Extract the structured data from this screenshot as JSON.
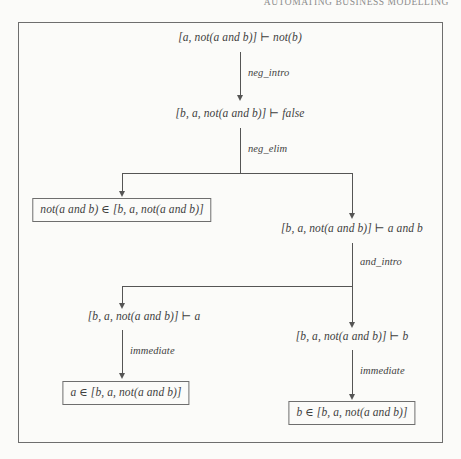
{
  "page": {
    "running_head": "AUTOMATING BUSINESS MODELLING"
  },
  "figure": {
    "nodes": [
      {
        "id": "goal",
        "text": "[a, not(a and b)] ⊢ not(b)",
        "boxed": false
      },
      {
        "id": "false-goal",
        "text": "[b, a, not(a and b)] ⊢ false",
        "boxed": false
      },
      {
        "id": "membership-notab",
        "text": "not(a and b) ∈ [b, a, not(a and b)]",
        "boxed": true
      },
      {
        "id": "a-and-b-goal",
        "text": "[b, a, not(a and b)] ⊢ a and b",
        "boxed": false
      },
      {
        "id": "a-goal",
        "text": "[b, a, not(a and b)] ⊢ a",
        "boxed": false
      },
      {
        "id": "b-goal",
        "text": "[b, a, not(a and b)] ⊢ b",
        "boxed": false
      },
      {
        "id": "membership-a",
        "text": "a ∈ [b, a, not(a and b)]",
        "boxed": true
      },
      {
        "id": "membership-b",
        "text": "b ∈ [b, a, not(a and b)]",
        "boxed": true
      }
    ],
    "edges": [
      {
        "id": "e1",
        "label": "neg_intro",
        "from": "goal",
        "to": "false-goal"
      },
      {
        "id": "e2",
        "label": "neg_elim",
        "from": "false-goal",
        "to": "membership-notab"
      },
      {
        "id": "e3",
        "label": "",
        "from": "false-goal",
        "to": "a-and-b-goal"
      },
      {
        "id": "e4",
        "label": "and_intro",
        "from": "a-and-b-goal",
        "to": "a-goal"
      },
      {
        "id": "e5",
        "label": "",
        "from": "a-and-b-goal",
        "to": "b-goal"
      },
      {
        "id": "e6",
        "label": "immediate",
        "from": "a-goal",
        "to": "membership-a"
      },
      {
        "id": "e7",
        "label": "immediate",
        "from": "b-goal",
        "to": "membership-b"
      }
    ],
    "labels": {
      "neg_intro": "neg_intro",
      "neg_elim": "neg_elim",
      "and_intro": "and_intro",
      "immediate_left": "immediate",
      "immediate_right": "immediate"
    },
    "colors": {
      "ink": "#3f3f3f",
      "rule": "#555555",
      "frame": "#6e6e6e",
      "paper": "#fbfbf9"
    }
  }
}
